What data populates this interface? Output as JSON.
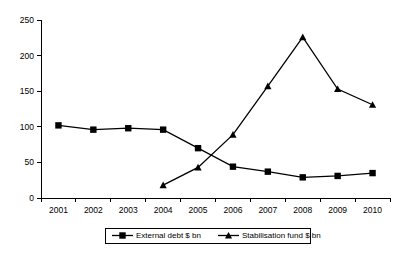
{
  "chart_data": {
    "type": "line",
    "title": "",
    "subtitle": "",
    "xlabel": "",
    "ylabel": "",
    "categories": [
      "2001",
      "2002",
      "2003",
      "2004",
      "2005",
      "2006",
      "2007",
      "2008",
      "2009",
      "2010"
    ],
    "series": [
      {
        "name": "External debt $ bn",
        "marker": "square",
        "color": "#000000",
        "values": [
          102,
          96,
          98,
          96,
          70,
          44,
          37,
          29,
          31,
          35
        ]
      },
      {
        "name": "Stabilisation fund $ bn",
        "marker": "triangle",
        "color": "#000000",
        "values": [
          null,
          null,
          null,
          18,
          43,
          89,
          157,
          226,
          153,
          131
        ]
      }
    ],
    "ylim": [
      0,
      250
    ],
    "yticks": [
      0,
      50,
      100,
      150,
      200,
      250
    ],
    "ytick_labels": [
      "0",
      "50",
      "100",
      "150",
      "200",
      "250"
    ],
    "xtick_labels": [
      "2001",
      "2002",
      "2003",
      "2004",
      "2005",
      "2006",
      "2007",
      "2008",
      "2009",
      "2010"
    ],
    "grid": false,
    "legend_position": "bottom",
    "legend_entries": [
      "External debt $ bn",
      "Stabilisation fund $ bn"
    ]
  },
  "axes": {
    "y_axis_name": "value-axis",
    "x_axis_name": "year-axis"
  },
  "legend": {
    "entry_0_label": "External debt $ bn",
    "entry_1_label": "Stabilisation fund $ bn"
  }
}
